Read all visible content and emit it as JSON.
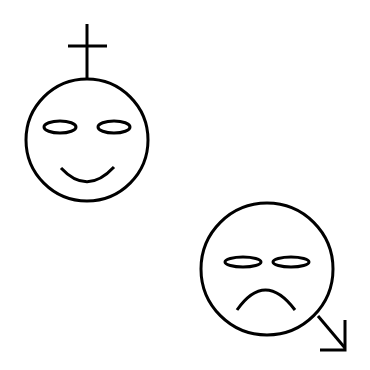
{
  "figure": {
    "colors": {
      "background": "#ffffff",
      "stroke": "#000000"
    },
    "faces": [
      {
        "name": "happy-face",
        "expression": "smile",
        "attachment": "cross"
      },
      {
        "name": "sad-face",
        "expression": "frown",
        "attachment": "arrow-down-right"
      }
    ]
  }
}
